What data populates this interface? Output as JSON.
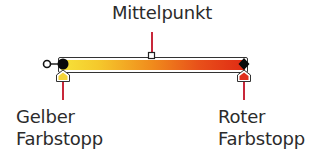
{
  "title": "Mittelpunkt",
  "left_stop": {
    "line1": "Gelber",
    "line2": "Farbstopp",
    "color": "#f5d43a"
  },
  "right_stop": {
    "line1": "Roter",
    "line2": "Farbstopp",
    "color": "#e0301e"
  },
  "gradient": {
    "start_color": "#f7e33a",
    "mid_color": "#f08a1c",
    "end_color": "#e02a14",
    "midpoint_percent": 50
  },
  "colors": {
    "leader_line": "#c8283a",
    "outline": "#333333"
  }
}
